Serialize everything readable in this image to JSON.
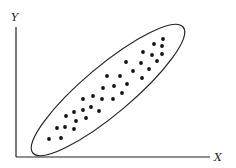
{
  "diagram": {
    "type": "scatter-with-ellipse",
    "x_axis_label": "X",
    "y_axis_label": "Y",
    "colors": {
      "axis": "#222222",
      "dot": "#111111",
      "ellipse": "#222222",
      "background": "#ffffff"
    },
    "ellipse": {
      "cx": 108,
      "cy": 90,
      "rx": 98,
      "ry": 24,
      "rotation_deg": -40
    },
    "points": [
      [
        49,
        139
      ],
      [
        61,
        138
      ],
      [
        57,
        128
      ],
      [
        65,
        127
      ],
      [
        74,
        129
      ],
      [
        66,
        116
      ],
      [
        74,
        112
      ],
      [
        76,
        121
      ],
      [
        83,
        110
      ],
      [
        86,
        118
      ],
      [
        91,
        107
      ],
      [
        99,
        111
      ],
      [
        83,
        99
      ],
      [
        93,
        96
      ],
      [
        102,
        99
      ],
      [
        103,
        88
      ],
      [
        113,
        99
      ],
      [
        114,
        86
      ],
      [
        122,
        93
      ],
      [
        107,
        76
      ],
      [
        120,
        76
      ],
      [
        127,
        84
      ],
      [
        126,
        62
      ],
      [
        133,
        71
      ],
      [
        141,
        63
      ],
      [
        142,
        78
      ],
      [
        149,
        69
      ],
      [
        143,
        52
      ],
      [
        152,
        55
      ],
      [
        157,
        61
      ],
      [
        162,
        54
      ],
      [
        154,
        44
      ],
      [
        162,
        46
      ],
      [
        163,
        39
      ]
    ]
  },
  "chart_data": {
    "type": "scatter",
    "title": "",
    "xlabel": "X",
    "ylabel": "Y",
    "grid": false,
    "legend": "none",
    "annotations": [
      "ellipse enclosing points indicating strong positive correlation"
    ],
    "points_pixel_coords": "see diagram.points"
  }
}
